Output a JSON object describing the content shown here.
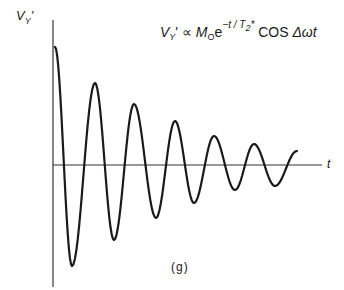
{
  "figure": {
    "panel_label": "(g)",
    "y_axis_label": "V",
    "y_axis_label_sub": "Y",
    "y_axis_label_prime": "'",
    "x_axis_label": "t",
    "equation": {
      "lhs": "V",
      "lhs_sub": "Y",
      "lhs_prime": "'",
      "relation": "∝",
      "m": "M",
      "m_sub": "O",
      "exp_base": "e",
      "exponent": "−t / T",
      "exponent_sub": "2",
      "exponent_star": "*",
      "trig": "COS",
      "trig_arg": "Δωt"
    },
    "colors": {
      "line": "#1a1a1a",
      "axis": "#333333",
      "background": "#ffffff"
    }
  },
  "chart_data": {
    "type": "line",
    "xlabel": "t",
    "ylabel": "V_Y'",
    "grid": false,
    "legend": null,
    "extrema_pixel_points": [
      {
        "x": 55,
        "y": 47
      },
      {
        "x": 72,
        "y": 266
      },
      {
        "x": 95,
        "y": 83
      },
      {
        "x": 114,
        "y": 240
      },
      {
        "x": 134,
        "y": 104
      },
      {
        "x": 156,
        "y": 218
      },
      {
        "x": 175,
        "y": 121
      },
      {
        "x": 194,
        "y": 203
      },
      {
        "x": 214,
        "y": 136
      },
      {
        "x": 235,
        "y": 190
      },
      {
        "x": 254,
        "y": 144
      },
      {
        "x": 275,
        "y": 186
      },
      {
        "x": 297,
        "y": 151
      }
    ],
    "axis_origin_pixel": {
      "x": 53,
      "y": 165
    },
    "normalized_extrema": [
      1.0,
      -0.85,
      0.69,
      -0.65,
      0.53,
      -0.46,
      0.38,
      -0.32,
      0.25,
      -0.22,
      0.18,
      -0.18,
      0.12
    ]
  }
}
